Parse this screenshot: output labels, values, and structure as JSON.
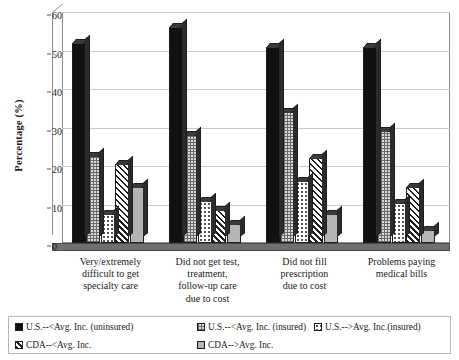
{
  "chart_data": {
    "type": "bar",
    "title": "",
    "xlabel": "",
    "ylabel": "Percentage (%)",
    "ylim": [
      0,
      60
    ],
    "yticks": [
      0,
      10,
      20,
      30,
      40,
      50,
      60
    ],
    "grid": true,
    "legend_position": "bottom",
    "categories": [
      "Very/extremely difficult to get specialty care",
      "Did not get test, treatment, follow-up care due to cost",
      "Did not fill prescription due to cost",
      "Problems paying medical bills"
    ],
    "category_lines": [
      [
        "Very/extremely",
        "difficult to get",
        "specialty care"
      ],
      [
        "Did not get test,",
        "treatment,",
        "follow-up care",
        "due to cost"
      ],
      [
        "Did not fill",
        "prescription",
        "due to cost"
      ],
      [
        "Problems paying",
        "medical bills"
      ]
    ],
    "series": [
      {
        "name": "U.S.--<Avg. Inc. (uninsured)",
        "pattern": "solid-black",
        "values": [
          52,
          56,
          51,
          51
        ]
      },
      {
        "name": "U.S.--<Avg. Inc. (insured)",
        "pattern": "checkered",
        "values": [
          22.5,
          28,
          34,
          29
        ]
      },
      {
        "name": "U.S.-->Avg. Inc.(insured)",
        "pattern": "dotted",
        "values": [
          7.5,
          11,
          16,
          10.5
        ]
      },
      {
        "name": "CDA--<Avg. Inc.",
        "pattern": "diagonal",
        "values": [
          20.5,
          8.5,
          22,
          14.5
        ]
      },
      {
        "name": "CDA-->Avg. Inc.",
        "pattern": "light-gray",
        "values": [
          14.5,
          5,
          7.5,
          3.5
        ]
      }
    ]
  },
  "legend": {
    "items": [
      {
        "label": "U.S.--<Avg. Inc. (uninsured)",
        "swatch": "solid-black-swatch"
      },
      {
        "label": "U.S.--<Avg. Inc. (insured)",
        "swatch": "checkered-swatch"
      },
      {
        "label": "U.S.-->Avg. Inc.(insured)",
        "swatch": "dotted-swatch"
      },
      {
        "label": "CDA--<Avg. Inc.",
        "swatch": "diagonal-swatch"
      },
      {
        "label": "CDA-->Avg. Inc.",
        "swatch": "light-gray-swatch"
      }
    ]
  }
}
